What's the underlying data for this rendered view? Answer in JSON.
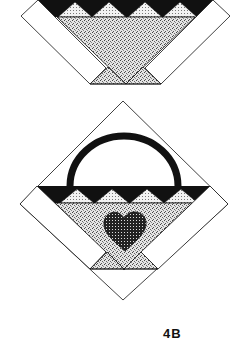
{
  "figure": {
    "type": "quilt-block-diagram",
    "blocks": [
      {
        "name": "basket-block",
        "elements": [
          "black-band",
          "sawtooth-triangles",
          "speckled-basket",
          "side-strips",
          "base-triangles"
        ]
      },
      {
        "name": "heart-basket-block",
        "elements": [
          "handle-arc",
          "black-band",
          "sawtooth-triangles",
          "speckled-basket",
          "heart-applique",
          "side-strips",
          "base-triangles",
          "diamond-outline"
        ]
      }
    ],
    "caption": "4B",
    "colors": {
      "black": "#111111",
      "white": "#ffffff",
      "speckle": "#bdbdbd",
      "dots": "#d6d6d6",
      "heart": "#3a3a3a"
    }
  }
}
